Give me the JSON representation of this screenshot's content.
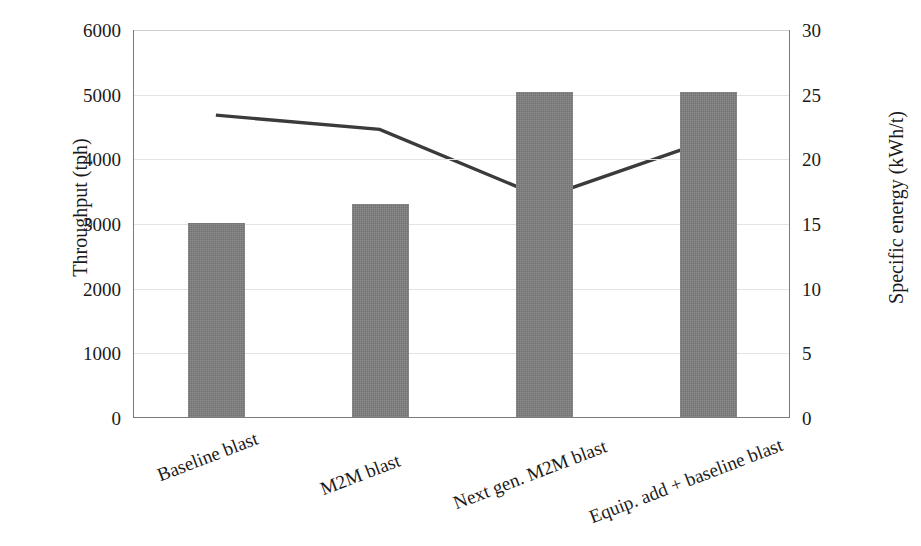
{
  "chart_data": {
    "type": "bar",
    "title": "",
    "subtitle": "",
    "categories": [
      "Baseline blast",
      "M2M blast",
      "Next gen. M2M blast",
      "Equip. add + baseline blast"
    ],
    "series": [
      {
        "name": "Throughput",
        "type": "bar",
        "axis": "left",
        "unit": "tph",
        "color": "#7f7f7f",
        "values": [
          3000,
          3300,
          5020,
          5030
        ]
      },
      {
        "name": "Specific energy",
        "type": "line",
        "axis": "right",
        "unit": "kWh/t",
        "color": "#3b3b3b",
        "values": [
          23.4,
          22.3,
          17.0,
          21.4
        ]
      }
    ],
    "xlabel": "",
    "ylabel": "Throughput (tph)",
    "y2label": "Specific energy (kWh/t)",
    "ylim": [
      0,
      6000
    ],
    "y2lim": [
      0,
      30
    ],
    "yticks": [
      0,
      1000,
      2000,
      3000,
      4000,
      5000,
      6000
    ],
    "y2ticks": [
      0,
      5,
      10,
      15,
      20,
      25,
      30
    ],
    "ytick_labels": [
      "0",
      "1000",
      "2000",
      "3000",
      "4000",
      "5000",
      "6000"
    ],
    "y2tick_labels": [
      "0",
      "5",
      "10",
      "15",
      "20",
      "25",
      "30"
    ],
    "grid": true,
    "grid_axis": "y",
    "legend": false,
    "legend_position": "none",
    "annotations": []
  },
  "axes": {
    "left_title": "Throughput (tph)",
    "right_title": "Specific energy (kWh/t)"
  }
}
